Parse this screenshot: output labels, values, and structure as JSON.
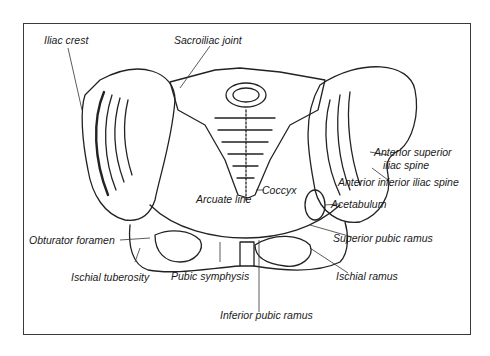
{
  "diagram": {
    "labels": [
      {
        "id": "iliac-crest",
        "text": "Iliac crest"
      },
      {
        "id": "sacroiliac-joint",
        "text": "Sacroiliac joint"
      },
      {
        "id": "anterior-superior-iliac-spine",
        "text": "Anterior superior",
        "text2": "iliac spine"
      },
      {
        "id": "anterior-inferior-iliac-spine",
        "text": "Anterior inferior iliac spine"
      },
      {
        "id": "coccyx",
        "text": "Coccyx"
      },
      {
        "id": "arcuate-line",
        "text": "Arcuate line"
      },
      {
        "id": "acetabulum",
        "text": "Acetabulum"
      },
      {
        "id": "obturator-foramen",
        "text": "Obturator foramen"
      },
      {
        "id": "superior-pubic-ramus",
        "text": "Superior pubic ramus"
      },
      {
        "id": "ischial-tuberosity",
        "text": "Ischial tuberosity"
      },
      {
        "id": "pubic-symphysis",
        "text": "Pubic symphysis"
      },
      {
        "id": "ischial-ramus",
        "text": "Ischial ramus"
      },
      {
        "id": "inferior-pubic-ramus",
        "text": "Inferior pubic ramus"
      }
    ]
  }
}
